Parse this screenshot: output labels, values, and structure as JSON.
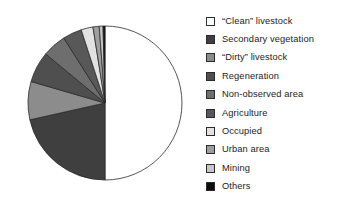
{
  "chart_data": {
    "type": "pie",
    "title": "",
    "subtitle": "",
    "xlabel": "",
    "ylabel": "",
    "legend_position": "right",
    "grid": false,
    "start_angle_deg": 0,
    "direction": "clockwise",
    "categories": [
      "“Clean” livestock",
      "Secondary vegetation",
      "“Dirty” livestock",
      "Regeneration",
      "Non-observed area",
      "Agriculture",
      "Occupied",
      "Urban area",
      "Mining",
      "Others"
    ],
    "values": [
      50.0,
      21.5,
      8.0,
      6.5,
      5.0,
      4.0,
      2.5,
      1.3,
      0.8,
      0.4
    ],
    "colors": [
      "#ffffff",
      "#3f3f3f",
      "#8c8c8c",
      "#4f4f4f",
      "#6e6e6e",
      "#585858",
      "#e2e2e2",
      "#9e9e9e",
      "#c6c6c6",
      "#0d0d0d"
    ],
    "slice_edge_color": "#2b2b2b"
  },
  "legend": {
    "items": [
      {
        "label": "“Clean” livestock",
        "color": "#ffffff"
      },
      {
        "label": "Secondary vegetation",
        "color": "#3f3f3f"
      },
      {
        "label": "“Dirty” livestock",
        "color": "#8c8c8c"
      },
      {
        "label": "Regeneration",
        "color": "#4f4f4f"
      },
      {
        "label": "Non-observed area",
        "color": "#6e6e6e"
      },
      {
        "label": "Agriculture",
        "color": "#585858"
      },
      {
        "label": "Occupied",
        "color": "#e2e2e2"
      },
      {
        "label": "Urban area",
        "color": "#9e9e9e"
      },
      {
        "label": "Mining",
        "color": "#c6c6c6"
      },
      {
        "label": "Others",
        "color": "#0d0d0d"
      }
    ]
  },
  "pie_geometry": {
    "cx": 105,
    "cy": 103,
    "r": 77
  }
}
